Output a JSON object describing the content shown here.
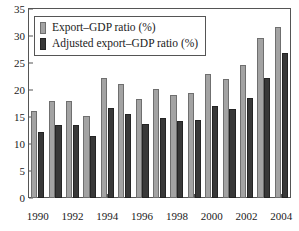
{
  "chart_data": {
    "type": "bar",
    "title": "",
    "xlabel": "",
    "ylabel": "",
    "ylim": [
      0,
      35
    ],
    "ytick_step": 5,
    "yticks": [
      "0",
      "5",
      "10",
      "15",
      "20",
      "25",
      "30",
      "35"
    ],
    "grid": false,
    "legend_position": "upper-left",
    "categories": [
      "1990",
      "1991",
      "1992",
      "1993",
      "1994",
      "1995",
      "1996",
      "1997",
      "1998",
      "1999",
      "2000",
      "2001",
      "2002",
      "2003",
      "2004"
    ],
    "xtick_labels": [
      "1990",
      "1992",
      "1994",
      "1996",
      "1998",
      "2000",
      "2002",
      "2004"
    ],
    "series": [
      {
        "name": "Export–GDP ratio (%)",
        "color": "#a3a3a3",
        "values": [
          16.2,
          17.9,
          18.0,
          15.2,
          22.2,
          21.2,
          18.3,
          20.1,
          19.0,
          19.4,
          22.9,
          22.1,
          24.7,
          29.6,
          31.7
        ]
      },
      {
        "name": "Adjusted export–GDP ratio (%)",
        "color": "#383838",
        "values": [
          12.2,
          13.5,
          13.5,
          11.4,
          16.6,
          15.6,
          13.7,
          14.9,
          14.2,
          14.4,
          17.1,
          16.5,
          18.5,
          22.2,
          26.9
        ]
      }
    ]
  },
  "legend": {
    "items": [
      {
        "label": "Export–GDP ratio (%)",
        "swatch": "light"
      },
      {
        "label": "Adjusted export–GDP ratio (%)",
        "swatch": "dark"
      }
    ]
  },
  "caption": {
    "text": ""
  }
}
